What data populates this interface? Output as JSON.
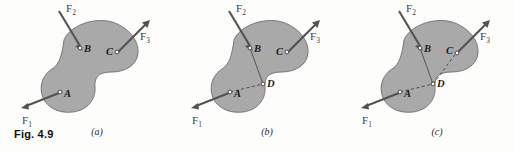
{
  "figure": {
    "caption": "Fig. 4.9",
    "background_color": "#fdfdfc",
    "body_fill_color": "#a9a9a9",
    "body_stroke_color": "#6e6e6e",
    "force_color": "#555253"
  },
  "panels": [
    {
      "id": "a",
      "label": "(a)",
      "points": [
        {
          "name": "A",
          "label": "A"
        },
        {
          "name": "B",
          "label": "B"
        },
        {
          "name": "C",
          "label": "C"
        }
      ],
      "forces": [
        {
          "name": "F1",
          "base": "F",
          "sub": "1",
          "applied_at": "A",
          "direction": "down-left"
        },
        {
          "name": "F2",
          "base": "F",
          "sub": "2",
          "applied_at": "B",
          "direction": "down-right"
        },
        {
          "name": "F3",
          "base": "F",
          "sub": "3",
          "applied_at": "C",
          "direction": "up-right"
        }
      ],
      "construction_lines": []
    },
    {
      "id": "b",
      "label": "(b)",
      "points": [
        {
          "name": "A",
          "label": "A"
        },
        {
          "name": "B",
          "label": "B"
        },
        {
          "name": "C",
          "label": "C"
        },
        {
          "name": "D",
          "label": "D"
        }
      ],
      "forces": [
        {
          "name": "F1",
          "base": "F",
          "sub": "1",
          "applied_at": "A",
          "direction": "down-left"
        },
        {
          "name": "F2",
          "base": "F",
          "sub": "2",
          "applied_at": "B",
          "direction": "down-right"
        },
        {
          "name": "F3",
          "base": "F",
          "sub": "3",
          "applied_at": "C",
          "direction": "up-right"
        }
      ],
      "construction_lines": [
        {
          "from": "B",
          "to": "D",
          "style": "solid"
        },
        {
          "from": "A",
          "to": "D",
          "style": "dashed"
        }
      ]
    },
    {
      "id": "c",
      "label": "(c)",
      "points": [
        {
          "name": "A",
          "label": "A"
        },
        {
          "name": "B",
          "label": "B"
        },
        {
          "name": "C",
          "label": "C"
        },
        {
          "name": "D",
          "label": "D"
        }
      ],
      "forces": [
        {
          "name": "F1",
          "base": "F",
          "sub": "1",
          "applied_at": "A",
          "direction": "down-left"
        },
        {
          "name": "F2",
          "base": "F",
          "sub": "2",
          "applied_at": "B",
          "direction": "down-right"
        },
        {
          "name": "F3",
          "base": "F",
          "sub": "3",
          "applied_at": "D",
          "direction": "up-right"
        }
      ],
      "construction_lines": [
        {
          "from": "B",
          "to": "D",
          "style": "solid"
        },
        {
          "from": "A",
          "to": "D",
          "style": "dashed"
        },
        {
          "from": "D",
          "to": "C",
          "style": "dashed"
        }
      ]
    }
  ],
  "labels": {
    "A": "A",
    "B": "B",
    "C": "C",
    "D": "D",
    "F_base": "F",
    "sub_1": "1",
    "sub_2": "2",
    "sub_3": "3",
    "panel_a": "(a)",
    "panel_b": "(b)",
    "panel_c": "(c)"
  }
}
